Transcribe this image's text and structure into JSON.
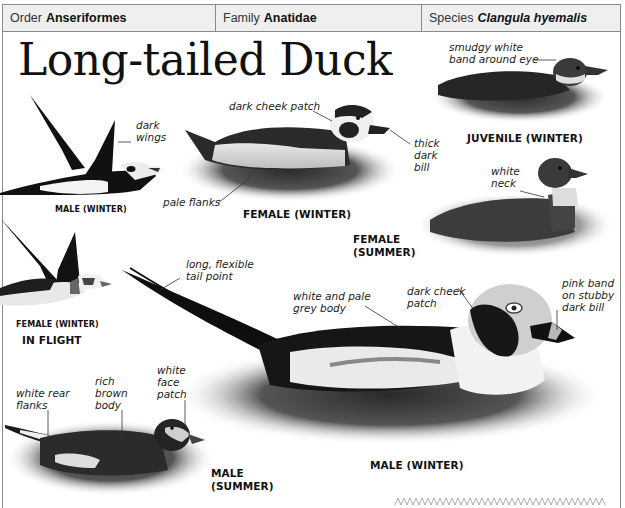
{
  "taxonomy": {
    "order": {
      "label": "Order",
      "value": "Anseriformes"
    },
    "family": {
      "label": "Family",
      "value": "Anatidae"
    },
    "species": {
      "label": "Species",
      "value": "Clangula hyemalis"
    }
  },
  "title": "Long-tailed Duck",
  "figures": [
    {
      "id": "male-winter-flight",
      "caption": "MALE (WINTER)",
      "annotations": [
        "dark\nwings"
      ]
    },
    {
      "id": "female-winter-swim",
      "caption": "FEMALE (WINTER)",
      "annotations": [
        "dark cheek patch",
        "thick\ndark\nbill",
        "pale flanks"
      ]
    },
    {
      "id": "juvenile-winter",
      "caption": "JUVENILE (WINTER)",
      "annotations": [
        "smudgy white\nband around eye"
      ]
    },
    {
      "id": "female-summer",
      "caption": "FEMALE\n(SUMMER)",
      "annotations": [
        "white\nneck"
      ]
    },
    {
      "id": "female-winter-flight",
      "caption": "FEMALE (WINTER)",
      "annotations": []
    },
    {
      "id": "male-winter-swim",
      "caption": "MALE (WINTER)",
      "annotations": [
        "long, flexible\ntail point",
        "white and pale\ngrey body",
        "dark cheek\npatch",
        "pink band\non stubby\ndark bill"
      ]
    },
    {
      "id": "male-summer",
      "caption": "MALE\n(SUMMER)",
      "annotations": [
        "white rear\nflanks",
        "rich\nbrown\nbody",
        "white\nface\npatch"
      ]
    }
  ],
  "group_label": "IN FLIGHT",
  "colors": {
    "border": "#8a8a8a",
    "taxbar_bg": "#efefef",
    "ink": "#111111",
    "water": "#3a3a3a"
  }
}
